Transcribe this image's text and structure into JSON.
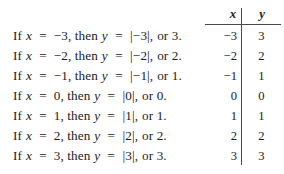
{
  "statements": {
    "lines": [
      {
        "prefix": "If",
        "var_x": "x",
        "eq1": "=",
        "xval": "−3,",
        "then": "then",
        "var_y": "y",
        "eq2": "=",
        "abs": "|−3|,",
        "or": "or",
        "result": "3."
      },
      {
        "prefix": "If",
        "var_x": "x",
        "eq1": "=",
        "xval": "−2,",
        "then": "then",
        "var_y": "y",
        "eq2": "=",
        "abs": "|−2|,",
        "or": "or",
        "result": "2."
      },
      {
        "prefix": "If",
        "var_x": "x",
        "eq1": "=",
        "xval": "−1,",
        "then": "then",
        "var_y": "y",
        "eq2": "=",
        "abs": "|−1|,",
        "or": "or",
        "result": "1."
      },
      {
        "prefix": "If",
        "var_x": "x",
        "eq1": "=",
        "xval": "0,",
        "then": "then",
        "var_y": "y",
        "eq2": "=",
        "abs": "|0|,",
        "or": "or",
        "result": "0."
      },
      {
        "prefix": "If",
        "var_x": "x",
        "eq1": "=",
        "xval": "1,",
        "then": "then",
        "var_y": "y",
        "eq2": "=",
        "abs": "|1|,",
        "or": "or",
        "result": "1."
      },
      {
        "prefix": "If",
        "var_x": "x",
        "eq1": "=",
        "xval": "2,",
        "then": "then",
        "var_y": "y",
        "eq2": "=",
        "abs": "|2|,",
        "or": "or",
        "result": "2."
      },
      {
        "prefix": "If",
        "var_x": "x",
        "eq1": "=",
        "xval": "3,",
        "then": "then",
        "var_y": "y",
        "eq2": "=",
        "abs": "|3|,",
        "or": "or",
        "result": "3."
      }
    ]
  },
  "chart_data": {
    "type": "table",
    "title": "",
    "columns": [
      "x",
      "y"
    ],
    "xlabel": "x",
    "ylabel": "y",
    "x": [
      -3,
      -2,
      -1,
      0,
      1,
      2,
      3
    ],
    "series": [
      {
        "name": "y",
        "values": [
          3,
          2,
          1,
          0,
          1,
          2,
          3
        ]
      }
    ],
    "rows": [
      {
        "x": "−3",
        "y": "3"
      },
      {
        "x": "−2",
        "y": "2"
      },
      {
        "x": "−1",
        "y": "1"
      },
      {
        "x": "0",
        "y": "0"
      },
      {
        "x": "1",
        "y": "1"
      },
      {
        "x": "2",
        "y": "2"
      },
      {
        "x": "3",
        "y": "3"
      }
    ],
    "grid": false,
    "legend": "none"
  },
  "colors": {
    "background": "#ffffff",
    "text": "#1b1b1b",
    "rule": "#4a4a4a"
  }
}
